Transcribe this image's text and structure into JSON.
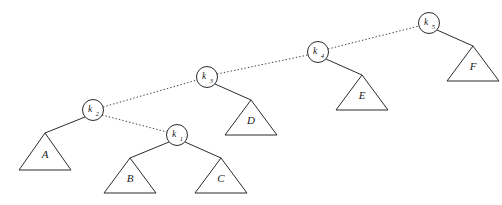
{
  "diagram": {
    "kind": "binary-search-tree-zig-zag-path",
    "background_color": "#ffffff",
    "line_color": "#2b2b2b",
    "width": 502,
    "height": 205,
    "nodes": [
      {
        "id": "k1",
        "label": "k",
        "subscript": "1",
        "cx": 177,
        "cy": 135,
        "r": 10.5
      },
      {
        "id": "k2",
        "label": "k",
        "subscript": "2",
        "cx": 93,
        "cy": 110,
        "r": 10.5
      },
      {
        "id": "k3",
        "label": "k",
        "subscript": "3",
        "cx": 207,
        "cy": 77,
        "r": 10.5
      },
      {
        "id": "k4",
        "label": "k",
        "subscript": "4",
        "cx": 318,
        "cy": 52,
        "r": 10.5
      },
      {
        "id": "k5",
        "label": "k",
        "subscript": "5",
        "cx": 429,
        "cy": 23,
        "r": 10.5
      }
    ],
    "dotted_edges": [
      {
        "id": "k2-k3",
        "from": "k2",
        "to": "k3",
        "x1": 103,
        "y1": 107,
        "x2": 197,
        "y2": 80
      },
      {
        "id": "k2-k1",
        "from": "k2",
        "to": "k1",
        "x1": 102,
        "y1": 115,
        "x2": 167,
        "y2": 132
      },
      {
        "id": "k3-k4",
        "from": "k3",
        "to": "k4",
        "x1": 217,
        "y1": 74,
        "x2": 308,
        "y2": 55
      },
      {
        "id": "k4-k5",
        "from": "k4",
        "to": "k5",
        "x1": 328,
        "y1": 49,
        "x2": 419,
        "y2": 26
      }
    ],
    "solid_edges": [
      {
        "id": "k2-A",
        "from": "k2",
        "to": "A",
        "x1": 85,
        "y1": 117,
        "x2": 45,
        "y2": 133
      },
      {
        "id": "k1-B",
        "from": "k1",
        "to": "B",
        "x1": 169,
        "y1": 142,
        "x2": 130,
        "y2": 158
      },
      {
        "id": "k1-C",
        "from": "k1",
        "to": "C",
        "x1": 185,
        "y1": 142,
        "x2": 221,
        "y2": 158
      },
      {
        "id": "k3-D",
        "from": "k3",
        "to": "D",
        "x1": 215,
        "y1": 84,
        "x2": 251,
        "y2": 100
      },
      {
        "id": "k4-E",
        "from": "k4",
        "to": "E",
        "x1": 326,
        "y1": 59,
        "x2": 362,
        "y2": 75
      },
      {
        "id": "k5-F",
        "from": "k5",
        "to": "F",
        "x1": 437,
        "y1": 30,
        "x2": 473,
        "y2": 46
      }
    ],
    "subtrees": [
      {
        "id": "A",
        "label": "A",
        "apex_x": 45,
        "apex_y": 133,
        "left_x": 19,
        "right_x": 71,
        "base_y": 170,
        "label_x": 45,
        "label_y": 155
      },
      {
        "id": "B",
        "label": "B",
        "apex_x": 130,
        "apex_y": 158,
        "left_x": 104,
        "right_x": 156,
        "base_y": 193,
        "label_x": 130,
        "label_y": 179
      },
      {
        "id": "C",
        "label": "C",
        "apex_x": 221,
        "apex_y": 158,
        "left_x": 195,
        "right_x": 247,
        "base_y": 193,
        "label_x": 221,
        "label_y": 179
      },
      {
        "id": "D",
        "label": "D",
        "apex_x": 251,
        "apex_y": 100,
        "left_x": 225,
        "right_x": 277,
        "base_y": 135,
        "label_x": 251,
        "label_y": 121
      },
      {
        "id": "E",
        "label": "E",
        "apex_x": 362,
        "apex_y": 75,
        "left_x": 336,
        "right_x": 388,
        "base_y": 110,
        "label_x": 362,
        "label_y": 96
      },
      {
        "id": "F",
        "label": "F",
        "apex_x": 473,
        "apex_y": 46,
        "left_x": 447,
        "right_x": 499,
        "base_y": 81,
        "label_x": 473,
        "label_y": 67
      }
    ]
  }
}
